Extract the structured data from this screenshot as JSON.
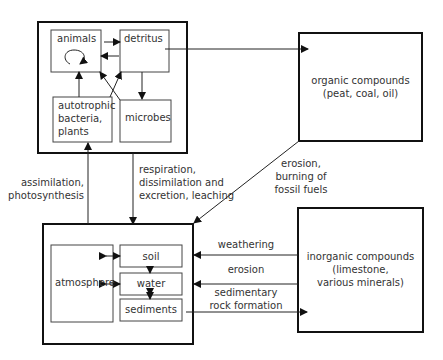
{
  "nodes": {
    "animals": "animals",
    "detritus": "detritus",
    "autotrophic": [
      "autotrophic",
      "bacteria,",
      "plants"
    ],
    "microbes": "microbes",
    "organic": [
      "organic compounds",
      "(peat, coal, oil)"
    ],
    "inorganic": [
      "inorganic compounds",
      "(limestone,",
      "various minerals)"
    ],
    "atmosphere": "atmosphere",
    "soil": "soil",
    "water": "water",
    "sediments": "sediments"
  },
  "edges": {
    "assimilation": [
      "assimilation,",
      "photosynthesis"
    ],
    "respiration": [
      "respiration,",
      "dissimilation and",
      "excretion, leaching"
    ],
    "erosion_burning": [
      "erosion,",
      "burning of",
      "fossil fuels"
    ],
    "weathering": "weathering",
    "erosion": "erosion",
    "sedimentary": [
      "sedimentary",
      "rock formation"
    ]
  },
  "colors": {
    "stroke": "#222222",
    "text": "#333333"
  }
}
